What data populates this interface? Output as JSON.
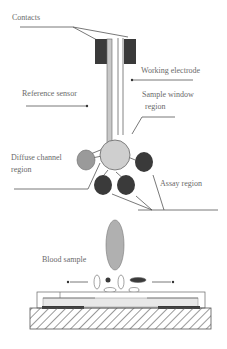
{
  "diagram": {
    "labels": {
      "contacts": "Contacts",
      "working_electrode": "Working electrode",
      "reference_sensor": "Reference sensor",
      "sample_window_line1": "Sample window",
      "sample_window_line2": "region",
      "diffuse_channel_line1": "Diffuse channel",
      "diffuse_channel_line2": "region",
      "assay_region": "Assay region",
      "blood_sample": "Blood sample"
    },
    "colors": {
      "dark_region": "#3a3a3a",
      "diffuse_region": "#9a9a9a",
      "sample_window": "#cfcfcf",
      "blood_sample": "#b0b0b0",
      "line": "#555555"
    }
  }
}
